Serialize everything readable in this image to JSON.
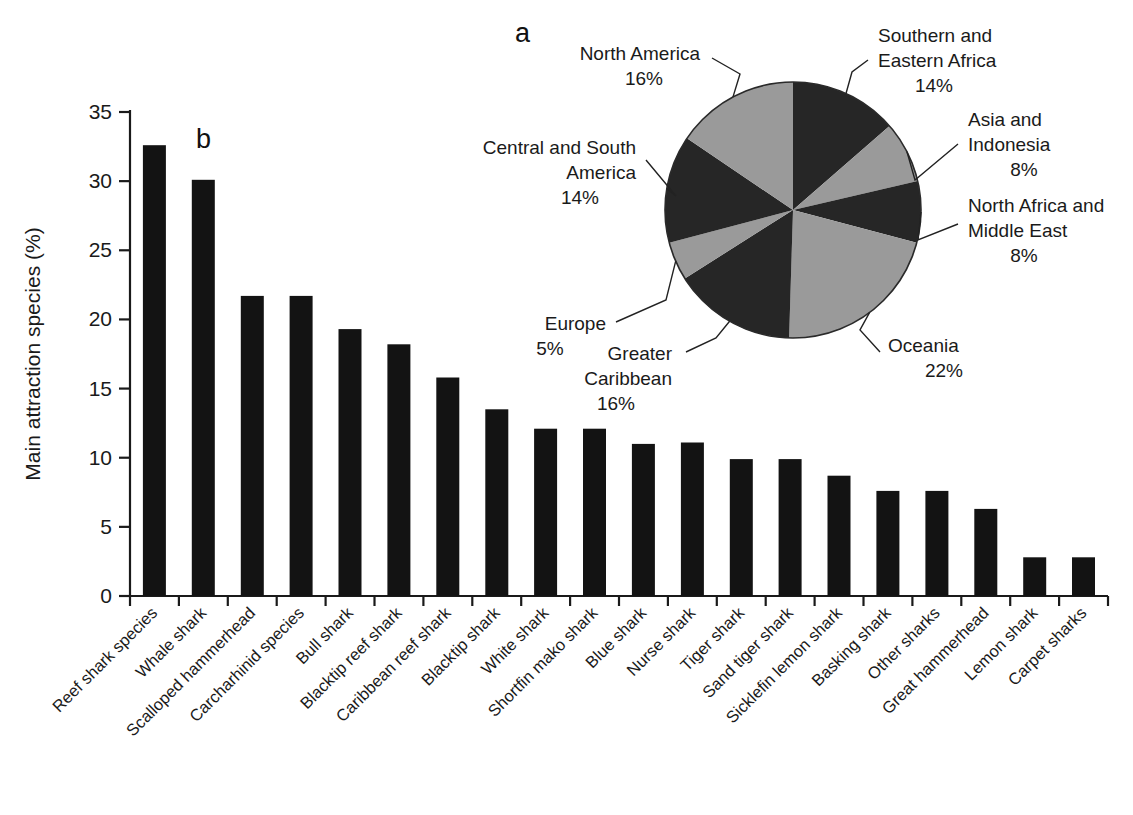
{
  "figure": {
    "panel_a_letter": "a",
    "panel_b_letter": "b"
  },
  "chart_data": [
    {
      "type": "pie",
      "panel": "a",
      "title": "",
      "legend_position": "callout-labels",
      "labels": [
        "Southern and Eastern Africa",
        "Asia and Indonesia",
        "North Africa and Middle East",
        "Oceania",
        "Greater Caribbean",
        "Europe",
        "Central and South America",
        "North America"
      ],
      "values": [
        14,
        8,
        8,
        22,
        16,
        5,
        14,
        16
      ],
      "value_suffix": "%",
      "slice_shades": [
        "dark",
        "light",
        "dark",
        "light",
        "dark",
        "light",
        "dark",
        "light"
      ],
      "start_angle_deg": 0,
      "direction": "clockwise",
      "callouts": [
        {
          "id": "southern-eastern-africa",
          "lines": [
            "Southern and",
            "Eastern Africa",
            "14%"
          ],
          "side": "right"
        },
        {
          "id": "asia-and-indonesia",
          "lines": [
            "Asia and",
            "Indonesia",
            "8%"
          ],
          "side": "right"
        },
        {
          "id": "north-africa-middle-east",
          "lines": [
            "North Africa and",
            "Middle East",
            "8%"
          ],
          "side": "right"
        },
        {
          "id": "oceania",
          "lines": [
            "Oceania",
            "22%"
          ],
          "side": "right"
        },
        {
          "id": "greater-caribbean",
          "lines": [
            "Greater",
            "Caribbean",
            "16%"
          ],
          "side": "left"
        },
        {
          "id": "europe",
          "lines": [
            "Europe",
            "5%"
          ],
          "side": "left"
        },
        {
          "id": "central-south-america",
          "lines": [
            "Central and South",
            "America",
            "14%"
          ],
          "side": "left"
        },
        {
          "id": "north-america",
          "lines": [
            "North America",
            "16%"
          ],
          "side": "left"
        }
      ]
    },
    {
      "type": "bar",
      "panel": "b",
      "title": "",
      "xlabel": "",
      "ylabel": "Main attraction species (%)",
      "ylim": [
        0,
        35
      ],
      "yticks": [
        0,
        5,
        10,
        15,
        20,
        25,
        30,
        35
      ],
      "ytick_labels": [
        "0",
        "5",
        "10",
        "15",
        "20",
        "25",
        "30",
        "35"
      ],
      "grid": false,
      "categories": [
        "Reef shark species",
        "Whale shark",
        "Scalloped hammerhead",
        "Carcharhinid species",
        "Bull shark",
        "Blacktip reef shark",
        "Caribbean reef shark",
        "Blacktip shark",
        "White shark",
        "Shortfin mako shark",
        "Blue shark",
        "Nurse shark",
        "Tiger shark",
        "Sand tiger shark",
        "Sicklefin lemon shark",
        "Basking shark",
        "Other sharks",
        "Great hammerhead",
        "Lemon shark",
        "Carpet sharks"
      ],
      "values": [
        32.6,
        30.1,
        21.7,
        21.7,
        19.3,
        18.2,
        15.8,
        13.5,
        12.1,
        12.1,
        11.0,
        11.1,
        9.9,
        9.9,
        8.7,
        7.6,
        7.6,
        6.3,
        2.8,
        2.8
      ],
      "bar_color": "#131313"
    }
  ]
}
